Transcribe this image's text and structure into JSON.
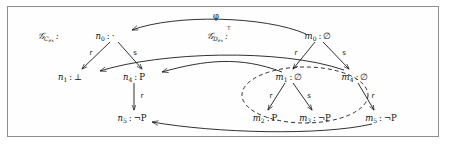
{
  "figure": {
    "frame": {
      "border_color": "#8d8d8d",
      "background": "#fefefe"
    },
    "morphism_label": "φ",
    "structures": [
      {
        "id": "left-structure-label",
        "text": "𝒢",
        "sub": "C",
        "subsub": "ex",
        "sup": "",
        "colon": ":"
      },
      {
        "id": "right-structure-label",
        "text": "𝒢",
        "sub": "D",
        "subsub": "ex",
        "sup": "⊤",
        "colon": ":"
      }
    ],
    "nodes": [
      {
        "id": "n0",
        "name": "n",
        "index": "0",
        "value": "·",
        "x": 112,
        "y": 36
      },
      {
        "id": "n1",
        "name": "n",
        "index": "1",
        "value": "⊥",
        "x": 78,
        "y": 77
      },
      {
        "id": "n4",
        "name": "n",
        "index": "4",
        "value": "P",
        "x": 138,
        "y": 77
      },
      {
        "id": "n5",
        "name": "n",
        "index": "5",
        "value": "¬P",
        "x": 130,
        "y": 118
      },
      {
        "id": "m0",
        "name": "m",
        "index": "0",
        "value": "∅",
        "x": 318,
        "y": 36
      },
      {
        "id": "m1",
        "name": "m",
        "index": "1",
        "value": "∅",
        "x": 288,
        "y": 77
      },
      {
        "id": "m4",
        "name": "m",
        "index": "4",
        "value": "∅",
        "x": 350,
        "y": 77
      },
      {
        "id": "m2",
        "name": "m",
        "index": "2",
        "value": "P",
        "x": 262,
        "y": 118
      },
      {
        "id": "m3",
        "name": "m",
        "index": "3",
        "value": "¬P",
        "x": 312,
        "y": 118
      },
      {
        "id": "m5",
        "name": "m",
        "index": "5",
        "value": "¬P",
        "x": 372,
        "y": 118
      }
    ],
    "edges": [
      {
        "id": "n0-n1",
        "from": "n0",
        "to": "n1",
        "label": "r"
      },
      {
        "id": "n0-n4",
        "from": "n0",
        "to": "n4",
        "label": "s"
      },
      {
        "id": "n4-n5",
        "from": "n4",
        "to": "n5",
        "label": "r"
      },
      {
        "id": "m0-m1",
        "from": "m0",
        "to": "m1",
        "label": "r"
      },
      {
        "id": "m0-m4",
        "from": "m0",
        "to": "m4",
        "label": "s"
      },
      {
        "id": "m1-m2",
        "from": "m1",
        "to": "m2",
        "label": "r"
      },
      {
        "id": "m1-m3",
        "from": "m1",
        "to": "m3",
        "label": "s"
      },
      {
        "id": "m4-m5",
        "from": "m4",
        "to": "m5",
        "label": "r"
      }
    ],
    "morphism_arrows": [
      {
        "id": "phi-m0-n0",
        "from": "m0",
        "to": "n0",
        "label": "φ"
      },
      {
        "id": "phi-m1-n4",
        "from": "m1",
        "to": "n4",
        "label": ""
      },
      {
        "id": "phi-m4-n1",
        "from": "m4",
        "to": "n1",
        "label": ""
      },
      {
        "id": "phi-m5-n5",
        "from": "m5",
        "to": "n5",
        "label": ""
      }
    ],
    "dashed_region": {
      "id": "dashed-ellipse",
      "cx": 305,
      "cy": 95,
      "rx": 62,
      "ry": 28,
      "style": "dashed"
    }
  }
}
